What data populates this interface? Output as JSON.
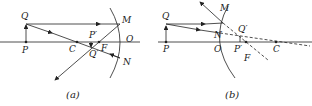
{
  "panels": [
    {
      "id": "a",
      "caption": "(a)",
      "labels": {
        "Q": "Q",
        "P": "P",
        "C": "C",
        "Pprime": "P′",
        "Qprime": "Q′",
        "F": "F",
        "M": "M",
        "O": "O",
        "N": "N"
      }
    },
    {
      "id": "b",
      "caption": "(b)",
      "labels": {
        "Q": "Q",
        "P": "P",
        "M": "M",
        "N": "N",
        "O": "O",
        "Qprime": "Q′",
        "Pprime": "P′",
        "F": "F",
        "C": "C"
      }
    }
  ],
  "colors": {
    "stroke": "#222222",
    "background": "#ffffff"
  }
}
